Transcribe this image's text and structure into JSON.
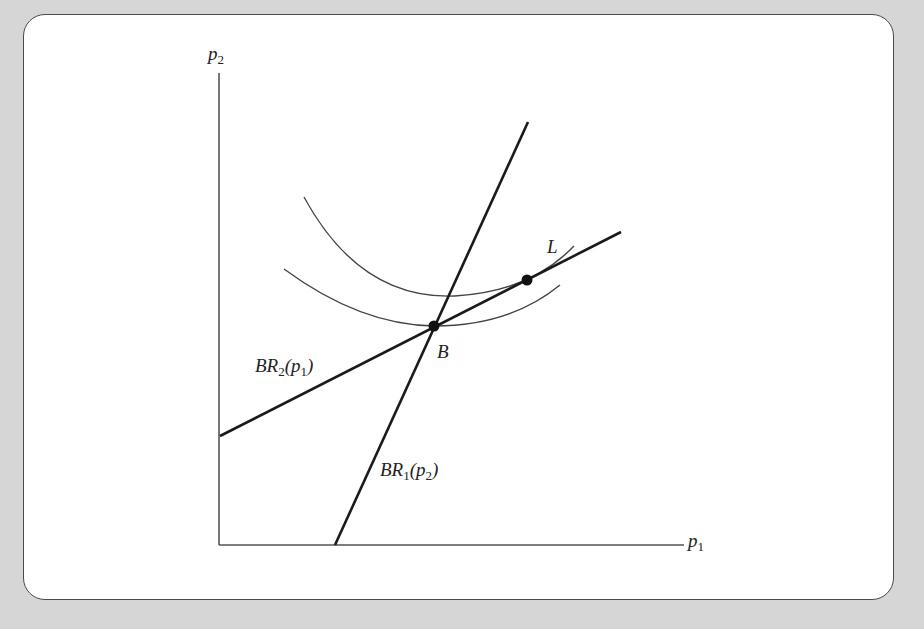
{
  "figure": {
    "axes": {
      "x_label": "p",
      "x_label_sub": "1",
      "y_label": "p",
      "y_label_sub": "2"
    },
    "curves": {
      "br1": {
        "name": "BR",
        "sub": "1",
        "arg": "p",
        "arg_sub": "2"
      },
      "br2": {
        "name": "BR",
        "sub": "2",
        "arg": "p",
        "arg_sub": "1"
      },
      "indifference_upper": "iso-profit curve through L",
      "indifference_lower": "iso-profit curve through B"
    },
    "points": {
      "B": "B",
      "L": "L"
    },
    "colors": {
      "background": "#d6d6d6",
      "panel": "#ffffff",
      "line": "#1a1a1a",
      "curve": "#444444"
    }
  }
}
